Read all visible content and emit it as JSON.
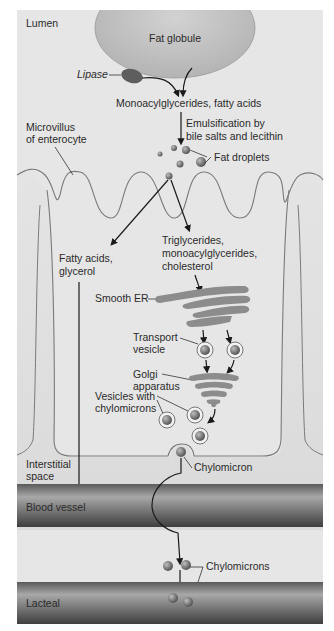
{
  "diagram": {
    "colors": {
      "background_panel": "#e6e6e6",
      "fat_globule": "#c8c8c8",
      "organelle": "#8c8c8c",
      "vessel_dark": "#555555",
      "vessel_light": "#9a9a9a",
      "text": "#2a2a2a"
    },
    "regions": {
      "lumen": "Lumen",
      "microvillus": "Microvillus",
      "microvillus_line2": "of enterocyte",
      "interstitial": "Interstitial",
      "interstitial_line2": "space",
      "blood_vessel": "Blood vessel",
      "lacteal": "Lacteal"
    },
    "labels": {
      "fat_globule": "Fat globule",
      "lipase": "Lipase",
      "products": "Monoacylglycerides, fatty acids",
      "emulsification_line1": "Emulsification by",
      "emulsification_line2": "bile salts and lecithin",
      "fat_droplets": "Fat droplets",
      "fatty_acids_line1": "Fatty acids,",
      "fatty_acids_line2": "glycerol",
      "lipids_line1": "Triglycerides,",
      "lipids_line2": "monoacylglycerides,",
      "lipids_line3": "cholesterol",
      "smooth_er": "Smooth ER",
      "transport_vesicle_line1": "Transport",
      "transport_vesicle_line2": "vesicle",
      "golgi_line1": "Golgi",
      "golgi_line2": "apparatus",
      "vesicles_line1": "Vesicles with",
      "vesicles_line2": "chylomicrons",
      "chylomicron": "Chylomicron",
      "chylomicrons": "Chylomicrons"
    }
  }
}
